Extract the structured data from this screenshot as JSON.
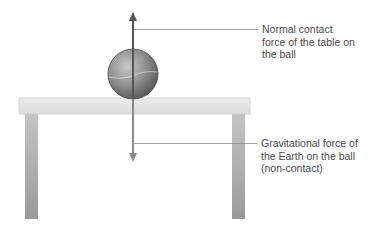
{
  "diagram": {
    "objects": {
      "ball": {
        "cx": 133,
        "cy": 74,
        "r": 25
      },
      "table": {
        "top_x": 19,
        "top_y": 98,
        "top_w": 231,
        "top_h": 16,
        "left_leg_x": 25,
        "right_leg_x": 232,
        "leg_w": 13,
        "leg_bottom": 219
      }
    },
    "forces": [
      {
        "id": "normal",
        "direction": "up",
        "label": "Normal contact\nforce of the table on\nthe ball",
        "color": "#555555"
      },
      {
        "id": "gravity",
        "direction": "down",
        "label": "Gravitational force of\nthe Earth on the ball\n(non-contact)",
        "color": "#8a8a8a"
      }
    ],
    "colors": {
      "leader_line": "#8c8c8c",
      "label_text": "#4a4a4a",
      "table_top": "#e4e4e4",
      "table_leg": "#a9a9a9"
    }
  }
}
